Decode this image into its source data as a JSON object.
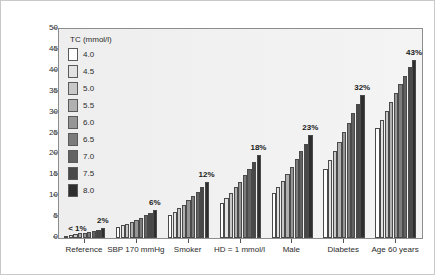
{
  "chart_data": {
    "type": "bar",
    "title": "",
    "subtitle": "",
    "xlabel": "",
    "ylabel": "5-year CVD risk/100 persons",
    "ylim": [
      0,
      50
    ],
    "yticks": [
      0,
      5,
      10,
      15,
      20,
      25,
      30,
      35,
      40,
      45,
      50
    ],
    "grid": false,
    "legend_position": "inside-top-left",
    "legend_title": "TC (mmol/l)",
    "series_name": "TC (mmol/l)",
    "series_levels": [
      "4.0",
      "4.5",
      "5.0",
      "5.5",
      "6.0",
      "6.5",
      "7.0",
      "7.5",
      "8.0"
    ],
    "series_colors": [
      "#ffffff",
      "#e2e2e2",
      "#c8c8c8",
      "#b0b0b0",
      "#969696",
      "#7c7c7c",
      "#626262",
      "#484848",
      "#2e2e2e"
    ],
    "categories": [
      "Reference",
      "SBP 170 mmHg",
      "Smoker",
      "HD = 1 mmol/l",
      "Male",
      "Diabetes",
      "Age 60 years"
    ],
    "group_annotations": [
      "< 1%",
      "2%",
      "6%",
      "12%",
      "18%",
      "23%",
      "32%",
      "43%"
    ],
    "annotations": [
      {
        "group": "Reference",
        "text": "< 1%",
        "position": "left-of-group"
      },
      {
        "group": "Reference",
        "text": "2%",
        "position": "above-last-bar"
      },
      {
        "group": "SBP 170 mmHg",
        "text": "6%",
        "position": "above-last-bar"
      },
      {
        "group": "Smoker",
        "text": "12%",
        "position": "above-last-bar"
      },
      {
        "group": "HD = 1 mmol/l",
        "text": "18%",
        "position": "above-last-bar"
      },
      {
        "group": "Male",
        "text": "23%",
        "position": "above-last-bar"
      },
      {
        "group": "Diabetes",
        "text": "32%",
        "position": "above-last-bar"
      },
      {
        "group": "Age 60 years",
        "text": "43%",
        "position": "above-last-bar"
      }
    ],
    "series": [
      {
        "name": "4.0",
        "values": [
          0.6,
          2.6,
          5.6,
          8.4,
          10.8,
          16.6,
          26.2
        ]
      },
      {
        "name": "4.5",
        "values": [
          0.7,
          3.0,
          6.3,
          9.6,
          12.2,
          18.6,
          28.2
        ]
      },
      {
        "name": "5.0",
        "values": [
          0.9,
          3.4,
          7.1,
          10.8,
          13.7,
          20.8,
          30.4
        ]
      },
      {
        "name": "5.5",
        "values": [
          1.1,
          3.9,
          8.0,
          12.1,
          15.3,
          23.0,
          32.6
        ]
      },
      {
        "name": "6.0",
        "values": [
          1.3,
          4.4,
          9.0,
          13.5,
          17.0,
          25.3,
          34.7
        ]
      },
      {
        "name": "6.5",
        "values": [
          1.5,
          4.9,
          10.0,
          15.0,
          18.8,
          27.6,
          36.8
        ]
      },
      {
        "name": "7.0",
        "values": [
          1.7,
          5.5,
          11.1,
          16.6,
          20.7,
          29.9,
          38.8
        ]
      },
      {
        "name": "7.5",
        "values": [
          2.0,
          6.1,
          12.2,
          18.2,
          22.6,
          32.1,
          40.8
        ]
      },
      {
        "name": "8.0",
        "values": [
          2.3,
          6.8,
          13.4,
          19.9,
          24.6,
          34.2,
          42.7
        ]
      }
    ]
  }
}
